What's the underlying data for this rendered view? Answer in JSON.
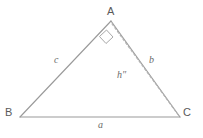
{
  "figure": {
    "kind": "geometry-diagram",
    "stroke_color": "#9a9a9a",
    "dashed_color": "#b0b0b0",
    "label_color": "#5a5a5a",
    "background_color": "#ffffff",
    "vertices": {
      "A": {
        "label": "A",
        "x": 111,
        "y": 21
      },
      "B": {
        "label": "B",
        "x": 20,
        "y": 117
      },
      "C": {
        "label": "C",
        "x": 180,
        "y": 117
      }
    },
    "sides": {
      "a": {
        "label": "a",
        "from": "B",
        "to": "C"
      },
      "b": {
        "label": "b",
        "from": "A",
        "to": "C"
      },
      "c": {
        "label": "c",
        "from": "B",
        "to": "A"
      }
    },
    "altitude": {
      "label": "h″",
      "from": "A",
      "to": "C",
      "style": "dashed"
    },
    "right_angle": {
      "name": "right-angle-mark",
      "at_vertex": "A",
      "marker": "square"
    }
  }
}
